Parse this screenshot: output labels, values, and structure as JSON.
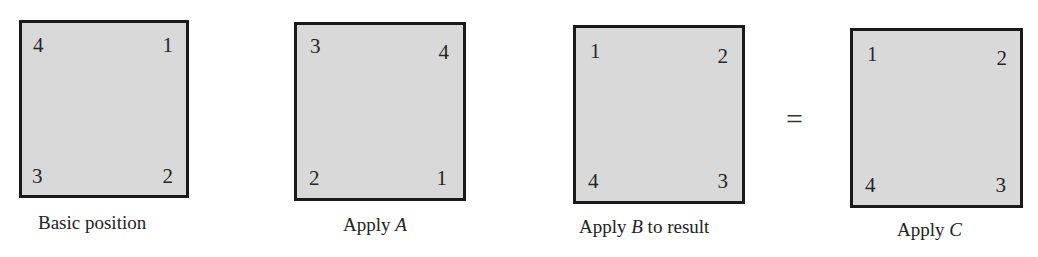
{
  "panels": [
    {
      "caption_pre": "Basic position",
      "caption_var": "",
      "caption_post": "",
      "corners": {
        "top_left": "4",
        "top_right": "1",
        "bottom_left": "3",
        "bottom_right": "2"
      }
    },
    {
      "caption_pre": "Apply ",
      "caption_var": "A",
      "caption_post": "",
      "corners": {
        "top_left": "3",
        "top_right": "4",
        "bottom_left": "2",
        "bottom_right": "1"
      }
    },
    {
      "caption_pre": "Apply ",
      "caption_var": "B",
      "caption_post": " to result",
      "corners": {
        "top_left": "1",
        "top_right": "2",
        "bottom_left": "4",
        "bottom_right": "3"
      }
    },
    {
      "caption_pre": "Apply ",
      "caption_var": "C",
      "caption_post": "",
      "corners": {
        "top_left": "1",
        "top_right": "2",
        "bottom_left": "4",
        "bottom_right": "3"
      }
    }
  ],
  "equals_sign": "=",
  "colors": {
    "square_fill": "#d9d9d9",
    "square_border": "#1a1a1a"
  }
}
